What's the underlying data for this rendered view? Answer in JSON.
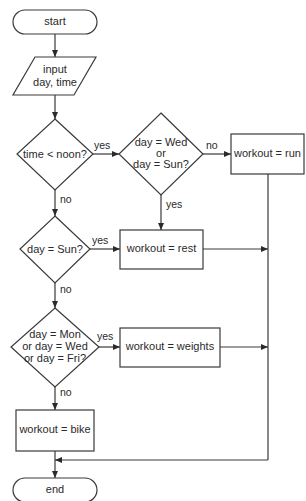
{
  "diagram": {
    "type": "flowchart",
    "title": "",
    "colors": {
      "stroke": "#3a3a3a",
      "fill": "#ffffff",
      "text": "#2a2a2a"
    },
    "nodes": {
      "start": {
        "shape": "terminator",
        "label": "start"
      },
      "input": {
        "shape": "parallelogram",
        "line1": "input",
        "line2": "day, time"
      },
      "decision_noon": {
        "shape": "diamond",
        "label": "time < noon?"
      },
      "decision_wed_sun": {
        "shape": "diamond",
        "line1": "day = Wed",
        "line2": "or",
        "line3": "day = Sun?"
      },
      "process_run": {
        "shape": "rectangle",
        "label": "workout = run"
      },
      "decision_sun": {
        "shape": "diamond",
        "label": "day = Sun?"
      },
      "process_rest": {
        "shape": "rectangle",
        "label": "workout = rest"
      },
      "decision_mwf": {
        "shape": "diamond",
        "line1": "day = Mon",
        "line2": "or day = Wed",
        "line3": "or day = Fri?"
      },
      "process_weights": {
        "shape": "rectangle",
        "label": "workout = weights"
      },
      "process_bike": {
        "shape": "rectangle",
        "label": "workout = bike"
      },
      "end": {
        "shape": "terminator",
        "label": "end"
      }
    },
    "edges": [
      {
        "from": "start",
        "to": "input",
        "label": ""
      },
      {
        "from": "input",
        "to": "decision_noon",
        "label": ""
      },
      {
        "from": "decision_noon",
        "to": "decision_wed_sun",
        "label": "yes"
      },
      {
        "from": "decision_noon",
        "to": "decision_sun",
        "label": "no"
      },
      {
        "from": "decision_wed_sun",
        "to": "process_run",
        "label": "no"
      },
      {
        "from": "decision_wed_sun",
        "to": "process_rest",
        "label": "yes"
      },
      {
        "from": "decision_sun",
        "to": "process_rest",
        "label": "yes"
      },
      {
        "from": "decision_sun",
        "to": "decision_mwf",
        "label": "no"
      },
      {
        "from": "decision_mwf",
        "to": "process_weights",
        "label": "yes"
      },
      {
        "from": "decision_mwf",
        "to": "process_bike",
        "label": "no"
      },
      {
        "from": "process_run",
        "to": "end",
        "label": ""
      },
      {
        "from": "process_rest",
        "to": "end",
        "label": ""
      },
      {
        "from": "process_weights",
        "to": "end",
        "label": ""
      },
      {
        "from": "process_bike",
        "to": "end",
        "label": ""
      }
    ],
    "edge_labels": {
      "yes": "yes",
      "no": "no"
    }
  }
}
